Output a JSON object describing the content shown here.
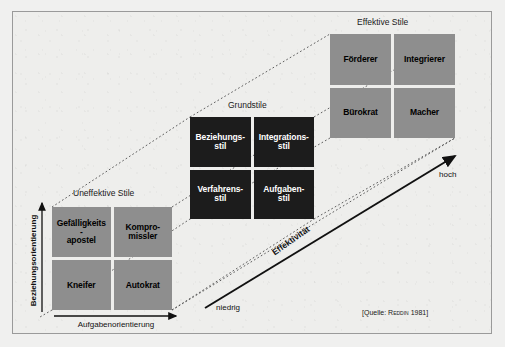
{
  "figure": {
    "groups": {
      "ineffective": {
        "caption": "Uneffektive Stile",
        "cells": [
          {
            "line1": "Gefälligkeits",
            "line2": "-",
            "line3": "apostel"
          },
          {
            "line1": "Kompro-",
            "line2": "missler",
            "line3": ""
          },
          {
            "line1": "Kneifer",
            "line2": "",
            "line3": ""
          },
          {
            "line1": "Autokrat",
            "line2": "",
            "line3": ""
          }
        ]
      },
      "basic": {
        "caption": "Grundstile",
        "cells": [
          {
            "line1": "Beziehungs-",
            "line2": "stil",
            "line3": ""
          },
          {
            "line1": "Integrations-",
            "line2": "stil",
            "line3": ""
          },
          {
            "line1": "Verfahrens-",
            "line2": "stil",
            "line3": ""
          },
          {
            "line1": "Aufgaben-",
            "line2": "stil",
            "line3": ""
          }
        ]
      },
      "effective": {
        "caption": "Effektive Stile",
        "cells": [
          {
            "line1": "Förderer",
            "line2": "",
            "line3": ""
          },
          {
            "line1": "Integrierer",
            "line2": "",
            "line3": ""
          },
          {
            "line1": "Bürokrat",
            "line2": "",
            "line3": ""
          },
          {
            "line1": "Macher",
            "line2": "",
            "line3": ""
          }
        ]
      }
    },
    "axes": {
      "y_label": "Beziehungsorientierung",
      "x_label": "Aufgabenorientierung",
      "depth_label": "Effektivität",
      "depth_low": "niedrig",
      "depth_high": "hoch"
    },
    "source": {
      "prefix": "[Quelle: ",
      "author": "Reddin",
      "year": " 1981]"
    },
    "colors": {
      "paper": "#eeeeec",
      "frame_rule": "#9a9a9a",
      "gray_cell": "#8e8e8e",
      "black_cell": "#1c1c1c",
      "ink": "#111111",
      "dotted_guide": "#555555"
    }
  }
}
